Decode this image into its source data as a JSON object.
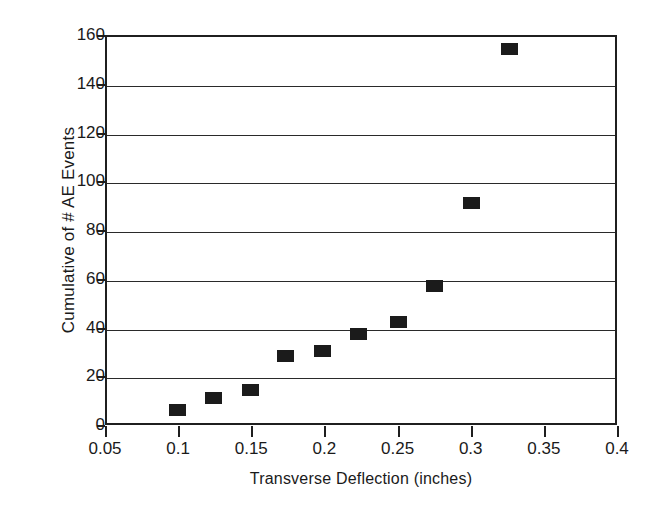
{
  "chart_data": {
    "type": "scatter",
    "title": "",
    "xlabel": "Transverse Deflection (inches)",
    "ylabel": "Cumulative of # AE Events",
    "xlim": [
      0.05,
      0.4
    ],
    "ylim": [
      0,
      160
    ],
    "xticks": [
      0.05,
      0.1,
      0.15,
      0.2,
      0.25,
      0.3,
      0.35,
      0.4
    ],
    "xtick_labels": [
      "0.05",
      "0.1",
      "0.15",
      "0.2",
      "0.25",
      "0.3",
      "0.35",
      "0.4"
    ],
    "yticks": [
      0,
      20,
      40,
      60,
      80,
      100,
      120,
      140,
      160
    ],
    "ytick_labels": [
      "0",
      "20",
      "40",
      "60",
      "80",
      "100",
      "120",
      "140",
      "160"
    ],
    "grid": "horizontal",
    "legend": null,
    "marker": "filled-square",
    "marker_color": "#1b1b1b",
    "axis_color": "#1f1f1f",
    "background": "#ffffff",
    "series": [
      {
        "name": "Cumulative AE Events",
        "x": [
          0.098,
          0.123,
          0.148,
          0.172,
          0.197,
          0.222,
          0.249,
          0.274,
          0.299,
          0.325
        ],
        "y": [
          7,
          12,
          15,
          29,
          31,
          38,
          43,
          58,
          92,
          155
        ]
      }
    ]
  }
}
